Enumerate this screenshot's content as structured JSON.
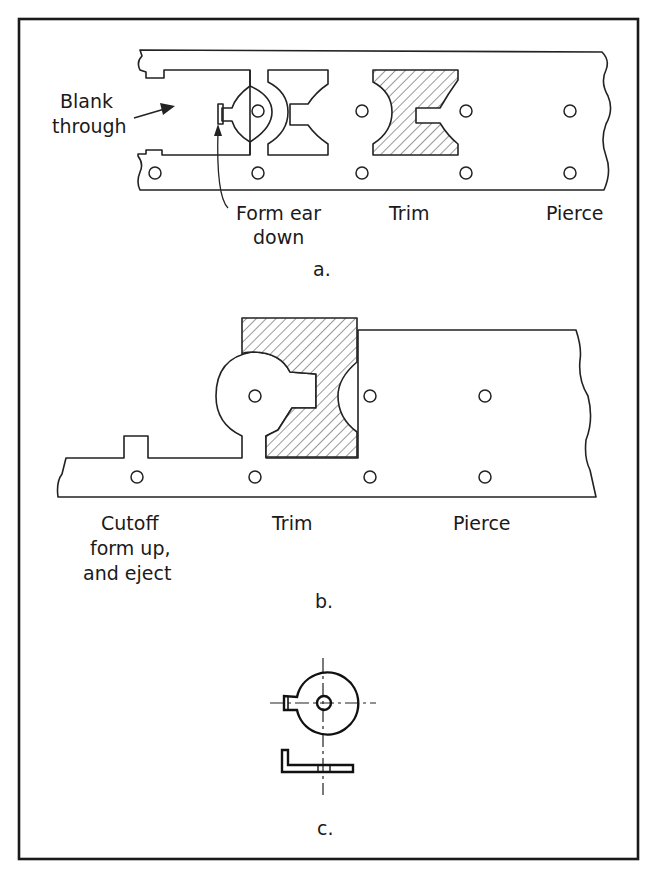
{
  "figure": {
    "frame": "bordered figure panel",
    "panels": [
      {
        "id": "a",
        "caption": "a.",
        "labels": {
          "blank_through_line1": "Blank",
          "blank_through_line2": "through",
          "form_ear_line1": "Form ear",
          "form_ear_line2": "down",
          "trim": "Trim",
          "pierce": "Pierce"
        }
      },
      {
        "id": "b",
        "caption": "b.",
        "labels": {
          "cutoff_line1": "Cutoff",
          "cutoff_line2": "form up,",
          "cutoff_line3": "and eject",
          "trim": "Trim",
          "pierce": "Pierce"
        }
      },
      {
        "id": "c",
        "caption": "c.",
        "labels": {}
      }
    ],
    "colors": {
      "line": "#222222",
      "background": "#ffffff"
    }
  }
}
